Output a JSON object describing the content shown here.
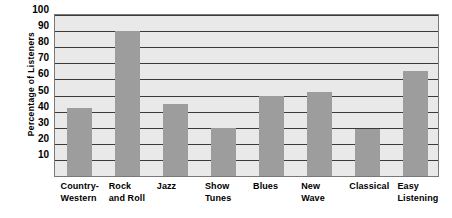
{
  "chart_data": {
    "type": "bar",
    "title": "",
    "subtitle": "",
    "xlabel": "",
    "ylabel": "Percentage  of  Listeners",
    "categories": [
      "Country-Western",
      "Rock and Roll",
      "Jazz",
      "Show Tunes",
      "Blues",
      "New Wave",
      "Classical",
      "Easy Listening"
    ],
    "category_lines": [
      [
        "Country-",
        "Western"
      ],
      [
        "Rock",
        "and Roll"
      ],
      [
        "Jazz",
        ""
      ],
      [
        "Show",
        "Tunes"
      ],
      [
        "Blues",
        ""
      ],
      [
        "New",
        "Wave"
      ],
      [
        "Classical",
        ""
      ],
      [
        "Easy",
        "Listening"
      ]
    ],
    "values": [
      42,
      90,
      45,
      30,
      50,
      52,
      29,
      65
    ],
    "ylim": [
      0,
      100
    ],
    "ytick_labels": [
      "100",
      "90",
      "80",
      "70",
      "60",
      "50",
      "40",
      "30",
      "20",
      "10"
    ],
    "ytick_values": [
      100,
      90,
      80,
      70,
      60,
      50,
      40,
      30,
      20,
      10
    ],
    "grid": true,
    "grid_axis": "y",
    "legend": false,
    "legend_position": "none",
    "bar_color": "#9d9d9d",
    "plot_background_color": "#e9e9e9",
    "gridline_color": "#3a3a3a",
    "border_color": "#787878",
    "text_color": "#000000",
    "page_background_color": "#ffffff"
  }
}
